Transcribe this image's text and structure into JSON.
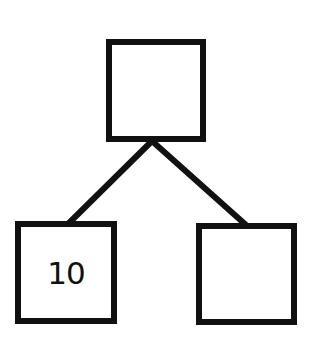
{
  "diagram": {
    "type": "tree",
    "nodes": [
      {
        "id": "top",
        "role": "whole",
        "value": ""
      },
      {
        "id": "left",
        "role": "part",
        "value": "10"
      },
      {
        "id": "right",
        "role": "part",
        "value": ""
      }
    ],
    "edges": [
      {
        "from": "top",
        "to": "left"
      },
      {
        "from": "top",
        "to": "right"
      }
    ],
    "colors": {
      "stroke": "#111111",
      "fill": "#ffffff",
      "background": "#ffffff"
    }
  }
}
